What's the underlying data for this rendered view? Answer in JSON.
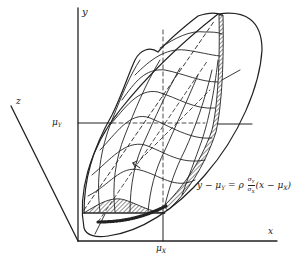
{
  "figure": {
    "axes": {
      "y_label": "y",
      "x_label": "x",
      "z_label": "z"
    },
    "markers": {
      "mu_y": "μ",
      "mu_y_sub": "Y",
      "mu_x": "μ",
      "mu_x_sub": "X"
    },
    "regression_equation": {
      "lhs": "y − μ",
      "lhs_sub": "Y",
      "eq": " = ρ",
      "frac_num": "σ",
      "frac_num_sub": "Y",
      "frac_den": "σ",
      "frac_den_sub": "X",
      "rhs": "(x − μ",
      "rhs_sub": "X",
      "rhs_close": ")"
    },
    "colors": {
      "ink": "#222222",
      "background": "#ffffff"
    }
  }
}
